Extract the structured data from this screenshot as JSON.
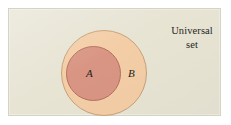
{
  "figure": {
    "type": "venn-diagram",
    "width": 231,
    "height": 125
  },
  "universal": {
    "label_line1": "Universal",
    "label_line2": "set",
    "fill_color": "#e7e4d4",
    "border_color": "#d6d3c2"
  },
  "sets": [
    {
      "name": "set-b",
      "label": "B",
      "fill_color": "#f3cda6",
      "stroke_color": "#c7a078",
      "center_x": 95,
      "center_y": 64,
      "radius": 43
    },
    {
      "name": "set-a",
      "label": "A",
      "fill_color": "#d99583",
      "stroke_color": "#b5705f",
      "center_x": 84,
      "center_y": 64,
      "radius": 27
    }
  ],
  "page_background": "#ffffff"
}
